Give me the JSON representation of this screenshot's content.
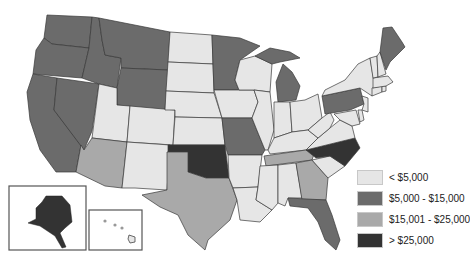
{
  "legend": {
    "items": [
      {
        "label": "< $5,000",
        "color": "#e6e6e6"
      },
      {
        "label": "$5,000 - $15,000",
        "color": "#6b6b6b"
      },
      {
        "label": "$15,001 - $25,000",
        "color": "#a9a9a9"
      },
      {
        "label": "> $25,000",
        "color": "#333333"
      }
    ]
  },
  "states": {
    "WA": "$5,000 - $15,000",
    "OR": "$5,000 - $15,000",
    "CA": "$5,000 - $15,000",
    "ID": "$5,000 - $15,000",
    "NV": "$5,000 - $15,000",
    "MT": "$5,000 - $15,000",
    "WY": "$5,000 - $15,000",
    "MN": "$5,000 - $15,000",
    "MI": "$5,000 - $15,000",
    "MO": "$5,000 - $15,000",
    "PA": "$5,000 - $15,000",
    "ME": "$5,000 - $15,000",
    "FL": "$5,000 - $15,000",
    "AZ": "$15,001 - $25,000",
    "TX": "$15,001 - $25,000",
    "TN": "$15,001 - $25,000",
    "GA": "$15,001 - $25,000",
    "OK": "> $25,000",
    "NC": "> $25,000",
    "AK": "> $25,000",
    "UT": "< $5,000",
    "CO": "< $5,000",
    "NM": "< $5,000",
    "ND": "< $5,000",
    "SD": "< $5,000",
    "NE": "< $5,000",
    "KS": "< $5,000",
    "IA": "< $5,000",
    "WI": "< $5,000",
    "IL": "< $5,000",
    "IN": "< $5,000",
    "OH": "< $5,000",
    "KY": "< $5,000",
    "WV": "< $5,000",
    "VA": "< $5,000",
    "AR": "< $5,000",
    "LA": "< $5,000",
    "MS": "< $5,000",
    "AL": "< $5,000",
    "SC": "< $5,000",
    "NY": "< $5,000",
    "VT": "< $5,000",
    "NH": "< $5,000",
    "MA": "< $5,000",
    "CT": "< $5,000",
    "RI": "< $5,000",
    "NJ": "< $5,000",
    "DE": "< $5,000",
    "MD": "< $5,000",
    "HI": "< $5,000"
  }
}
